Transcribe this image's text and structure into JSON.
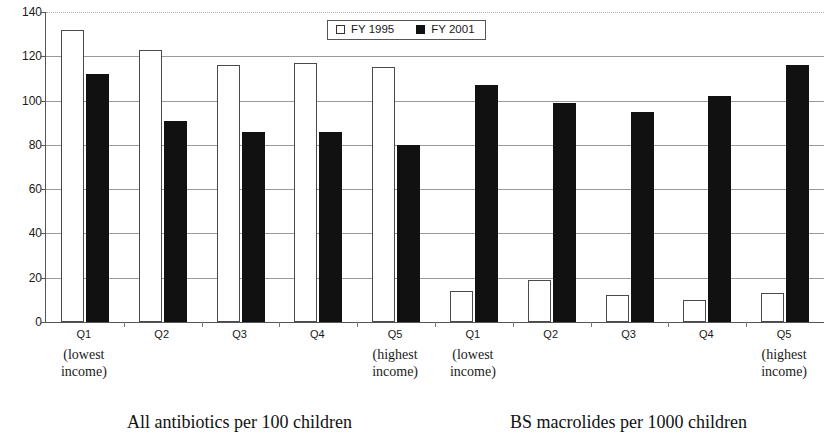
{
  "chart_data": {
    "type": "bar",
    "title": "",
    "xlabel": "",
    "ylabel": "",
    "ylim": [
      0,
      140
    ],
    "ytick_step": 20,
    "yticks": [
      140,
      120,
      100,
      80,
      60,
      40,
      20,
      0
    ],
    "grid": true,
    "legend_position": "top-center",
    "series": [
      {
        "name": "FY 1995",
        "color": "#ffffff",
        "values": [
          132,
          123,
          116,
          117,
          115,
          14,
          19,
          12,
          10,
          13
        ]
      },
      {
        "name": "FY 2001",
        "color": "#111111",
        "values": [
          112,
          91,
          86,
          86,
          80,
          107,
          99,
          95,
          102,
          116
        ]
      }
    ],
    "categories": [
      "Q1",
      "Q2",
      "Q3",
      "Q4",
      "Q5",
      "Q1",
      "Q2",
      "Q3",
      "Q4",
      "Q5"
    ],
    "category_notes": [
      "(lowest\nincome)",
      "",
      "",
      "",
      "(highest\nincome)",
      "(lowest\nincome)",
      "",
      "",
      "",
      "(highest\nincome)"
    ],
    "panels": [
      {
        "caption": "All antibiotics per 100 children",
        "categories": [
          "Q1",
          "Q2",
          "Q3",
          "Q4",
          "Q5"
        ],
        "series": [
          {
            "name": "FY 1995",
            "values": [
              132,
              123,
              116,
              117,
              115
            ]
          },
          {
            "name": "FY 2001",
            "values": [
              112,
              91,
              86,
              86,
              80
            ]
          }
        ]
      },
      {
        "caption": "BS macrolides per 1000 children",
        "categories": [
          "Q1",
          "Q2",
          "Q3",
          "Q4",
          "Q5"
        ],
        "series": [
          {
            "name": "FY 1995",
            "values": [
              14,
              19,
              12,
              10,
              13
            ]
          },
          {
            "name": "FY 2001",
            "values": [
              107,
              99,
              95,
              102,
              116
            ]
          }
        ]
      }
    ]
  },
  "legend": {
    "items": [
      {
        "label": "FY 1995",
        "swatch": "open-square-swatch"
      },
      {
        "label": "FY 2001",
        "swatch": "filled-square-swatch"
      }
    ]
  },
  "axis": {
    "y_labels": [
      "140",
      "120",
      "100",
      "80",
      "60",
      "40",
      "20",
      "0"
    ]
  },
  "captions": {
    "left_panel": "All antibiotics per 100 children",
    "right_panel": "BS macrolides per 1000 children"
  },
  "x_categories": [
    {
      "label": "Q1",
      "note": "(lowest\nincome)"
    },
    {
      "label": "Q2",
      "note": ""
    },
    {
      "label": "Q3",
      "note": ""
    },
    {
      "label": "Q4",
      "note": ""
    },
    {
      "label": "Q5",
      "note": "(highest\nincome)"
    },
    {
      "label": "Q1",
      "note": "(lowest\nincome)"
    },
    {
      "label": "Q2",
      "note": ""
    },
    {
      "label": "Q3",
      "note": ""
    },
    {
      "label": "Q4",
      "note": ""
    },
    {
      "label": "Q5",
      "note": "(highest\nincome)"
    }
  ]
}
